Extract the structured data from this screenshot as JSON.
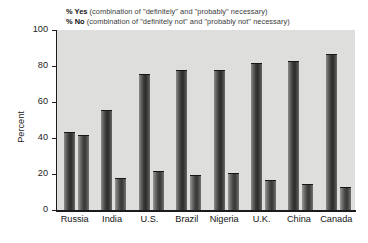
{
  "legend": {
    "yes": {
      "key": "% Yes",
      "rest": " (combination of \"definitely\" and \"probably\" necessary)"
    },
    "no": {
      "key": "% No",
      "rest": " (combination of \"definitely not\" and \"probably not\" necessary)"
    }
  },
  "axis": {
    "ylabel": "Percent",
    "yticks": [
      "100",
      "80",
      "60",
      "40",
      "20",
      "0"
    ]
  },
  "colors": {
    "plot_background": "#dededc",
    "axis": "#1b1b1b",
    "bar_yes": "#2c2c2a",
    "bar_no": "#4a4a48",
    "page_background": "#ffffff"
  },
  "chart_data": {
    "type": "bar",
    "title": "",
    "xlabel": "",
    "ylabel": "Percent",
    "ylim": [
      0,
      100
    ],
    "yticks": [
      0,
      20,
      40,
      60,
      80,
      100
    ],
    "grid": false,
    "legend_position": "top",
    "categories": [
      "Russia",
      "India",
      "U.S.",
      "Brazil",
      "Nigeria",
      "U.K.",
      "China",
      "Canada"
    ],
    "series": [
      {
        "name": "% Yes (combination of \"definitely\" and \"probably\" necessary)",
        "short_name": "% Yes",
        "values": [
          43,
          55,
          75,
          77,
          77,
          81,
          82,
          86
        ]
      },
      {
        "name": "% No (combination of \"definitely not\" and \"probably not\" necessary)",
        "short_name": "% No",
        "values": [
          41,
          17,
          21,
          19,
          20,
          16,
          14,
          12
        ]
      }
    ]
  }
}
